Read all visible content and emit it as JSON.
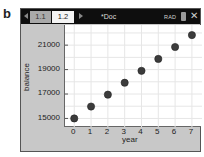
{
  "figure_label": "b",
  "window": {
    "tabs": [
      {
        "label": "1.1",
        "active": false
      },
      {
        "label": "1.2",
        "active": true
      }
    ],
    "doc_title": "*Doc",
    "mode_indicator": "RAD",
    "battery_icon": "battery-icon",
    "close_icon": "close-icon"
  },
  "colors": {
    "titlebar": "#0e0e0e",
    "window_bg": "#c8c8c8",
    "plot_bg": "#ffffff",
    "point": "#3c3c3c",
    "grid": "#e6e6e6"
  },
  "chart_data": {
    "type": "scatter",
    "title": "",
    "xlabel": "year",
    "ylabel": "balance",
    "x": [
      0,
      1,
      2,
      3,
      4,
      5,
      6,
      7
    ],
    "series": [
      {
        "name": "balance",
        "values": [
          15000,
          15975,
          16950,
          17925,
          18900,
          19875,
          20850,
          21825
        ]
      }
    ],
    "x_ticks": [
      "0",
      "1",
      "2",
      "3",
      "4",
      "5",
      "6",
      "7"
    ],
    "y_ticks": [
      "15000",
      "17000",
      "19000",
      "21000"
    ],
    "xlim": [
      -0.55,
      7.6
    ],
    "ylim": [
      14300,
      22650
    ],
    "grid": true,
    "legend": "none"
  }
}
